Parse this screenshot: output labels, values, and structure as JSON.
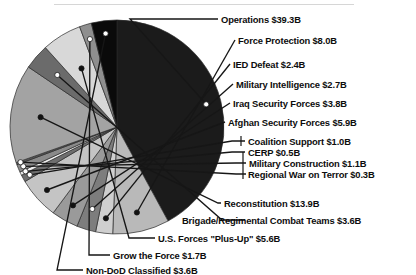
{
  "chart_data": {
    "type": "pie",
    "title": "",
    "subtitle": "",
    "units": "billions of USD",
    "total": 97.4,
    "legend_position": "callout-labels",
    "categories": [
      "Operations",
      "Force Protection",
      "IED Defeat",
      "Military Intelligence",
      "Iraq Security Forces",
      "Afghan Security Forces",
      "Coalition Support",
      "CERP",
      "Military Construction",
      "Regional War on Terror",
      "Reconstitution",
      "Brigade/Regimental Combat Teams",
      "U.S. Forces \"Plus-Up\"",
      "Grow the Force",
      "Non-DoD Classified"
    ],
    "values": [
      39.3,
      8.0,
      2.4,
      2.7,
      3.8,
      5.9,
      1.0,
      0.5,
      1.1,
      0.3,
      13.9,
      3.6,
      5.6,
      1.7,
      3.6
    ],
    "value_labels": [
      "$39.3B",
      "$8.0B",
      "$2.4B",
      "$2.7B",
      "$3.8B",
      "$5.9B",
      "$1.0B",
      "$0.5B",
      "$1.1B",
      "$0.3B",
      "$13.9B",
      "$3.6B",
      "$5.6B",
      "$1.7B",
      "$3.6B"
    ],
    "slice_colors": [
      "#1b1b1b",
      "#b9b9b9",
      "#cfcfcf",
      "#7d7d7d",
      "#9a9a9a",
      "#c4c4c4",
      "#6e6e6e",
      "#ededed",
      "#8a8a8a",
      "#5a5a5a",
      "#a3a3a3",
      "#6b6b6b",
      "#d8d8d8",
      "#8f8f8f",
      "#0a0a0a"
    ],
    "marker_colors": [
      "#ffffff",
      "#111111",
      "#111111",
      "#ffffff",
      "#111111",
      "#111111",
      "#ffffff",
      "#ffffff",
      "#ffffff",
      "#ffffff",
      "#111111",
      "#ffffff",
      "#111111",
      "#ffffff",
      "#ffffff"
    ]
  },
  "labels": {
    "operations": "Operations $39.3B",
    "force_protection": "Force Protection $8.0B",
    "ied_defeat": "IED Defeat $2.4B",
    "military_intelligence": "Military Intelligence $2.7B",
    "iraq_security_forces": "Iraq Security Forces $3.8B",
    "afghan_security_forces": "Afghan Security Forces $5.9B",
    "coalition_support": "Coalition Support $1.0B",
    "cerp": "CERP $0.5B",
    "military_construction": "Military Construction $1.1B",
    "regional_war_on_terror": "Regional War on Terror $0.3B",
    "reconstitution": "Reconstitution $13.9B",
    "brigade_combat_teams": "Brigade/Regimental Combat Teams $3.6B",
    "us_forces_plus_up": "U.S. Forces \"Plus-Up\" $5.6B",
    "grow_the_force": "Grow the Force $1.7B",
    "non_dod_classified": "Non-DoD Classified $3.6B"
  },
  "style": {
    "line_color": "#161616",
    "pie_outline": "#2a2a2a",
    "background": "#ffffff"
  }
}
